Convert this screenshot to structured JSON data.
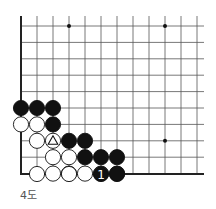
{
  "diagram": {
    "caption": "4도",
    "grid": {
      "origin_x": 21,
      "origin_y": 26,
      "spacing_x": 16,
      "spacing_y": 16.4,
      "cols": 12,
      "rows": 10,
      "right_edge_x": 204,
      "line_color": "#555555",
      "edge_color": "#222222"
    },
    "star_points": [
      {
        "col": 3,
        "row": 0
      },
      {
        "col": 9,
        "row": 0
      },
      {
        "col": 9,
        "row": 7
      }
    ],
    "stones": [
      {
        "col": 0,
        "row": 5,
        "color": "black"
      },
      {
        "col": 1,
        "row": 5,
        "color": "black"
      },
      {
        "col": 2,
        "row": 5,
        "color": "black"
      },
      {
        "col": 0,
        "row": 6,
        "color": "white"
      },
      {
        "col": 1,
        "row": 6,
        "color": "white"
      },
      {
        "col": 2,
        "row": 6,
        "color": "black"
      },
      {
        "col": 1,
        "row": 7,
        "color": "white"
      },
      {
        "col": 2,
        "row": 7,
        "color": "white",
        "mark": "triangle"
      },
      {
        "col": 3,
        "row": 7,
        "color": "black"
      },
      {
        "col": 4,
        "row": 7,
        "color": "black"
      },
      {
        "col": 2,
        "row": 8,
        "color": "white"
      },
      {
        "col": 3,
        "row": 8,
        "color": "white"
      },
      {
        "col": 4,
        "row": 8,
        "color": "black"
      },
      {
        "col": 5,
        "row": 8,
        "color": "black"
      },
      {
        "col": 6,
        "row": 8,
        "color": "black"
      },
      {
        "col": 2,
        "row": 9,
        "color": "white"
      },
      {
        "col": 3,
        "row": 9,
        "color": "white"
      },
      {
        "col": 4,
        "row": 9,
        "color": "white"
      },
      {
        "col": 5,
        "row": 9,
        "color": "white"
      },
      {
        "col": 6,
        "row": 9,
        "color": "black"
      },
      {
        "col": 1,
        "row": 10,
        "color": "white"
      },
      {
        "col": 3,
        "row": 10,
        "color": "white"
      },
      {
        "col": 5,
        "row": 10,
        "color": "black",
        "mark": "number",
        "label": "1"
      },
      {
        "col": 6,
        "row": 10,
        "color": "black"
      }
    ]
  }
}
